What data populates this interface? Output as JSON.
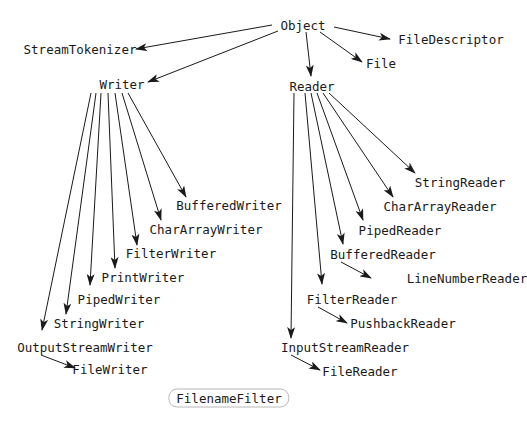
{
  "diagram": {
    "nodes": [
      {
        "id": "Object",
        "label": "Object",
        "x": 303,
        "y": 25
      },
      {
        "id": "StreamTokenizer",
        "label": "StreamTokenizer",
        "x": 80,
        "y": 49
      },
      {
        "id": "FileDescriptor",
        "label": "FileDescriptor",
        "x": 451,
        "y": 39
      },
      {
        "id": "File",
        "label": "File",
        "x": 381,
        "y": 63
      },
      {
        "id": "Writer",
        "label": "Writer",
        "x": 122,
        "y": 84
      },
      {
        "id": "Reader",
        "label": "Reader",
        "x": 312,
        "y": 86
      },
      {
        "id": "BufferedWriter",
        "label": "BufferedWriter",
        "x": 229,
        "y": 205
      },
      {
        "id": "CharArrayWriter",
        "label": "CharArrayWriter",
        "x": 206,
        "y": 229
      },
      {
        "id": "FilterWriter",
        "label": "FilterWriter",
        "x": 171,
        "y": 253
      },
      {
        "id": "PrintWriter",
        "label": "PrintWriter",
        "x": 143,
        "y": 277
      },
      {
        "id": "PipedWriter",
        "label": "PipedWriter",
        "x": 119,
        "y": 299
      },
      {
        "id": "StringWriter",
        "label": "StringWriter",
        "x": 99,
        "y": 323
      },
      {
        "id": "OutputStreamWriter",
        "label": "OutputStreamWriter",
        "x": 85,
        "y": 347
      },
      {
        "id": "FileWriter",
        "label": "FileWriter",
        "x": 110,
        "y": 369
      },
      {
        "id": "StringReader",
        "label": "StringReader",
        "x": 460,
        "y": 182
      },
      {
        "id": "CharArrayReader",
        "label": "CharArrayReader",
        "x": 440,
        "y": 206
      },
      {
        "id": "PipedReader",
        "label": "PipedReader",
        "x": 400,
        "y": 230
      },
      {
        "id": "BufferedReader",
        "label": "BufferedReader",
        "x": 383,
        "y": 254
      },
      {
        "id": "LineNumberReader",
        "label": "LineNumberReader",
        "x": 467,
        "y": 278
      },
      {
        "id": "FilterReader",
        "label": "FilterReader",
        "x": 352,
        "y": 299
      },
      {
        "id": "PushbackReader",
        "label": "PushbackReader",
        "x": 403,
        "y": 323
      },
      {
        "id": "InputStreamReader",
        "label": "InputStreamReader",
        "x": 345,
        "y": 347
      },
      {
        "id": "FileReader",
        "label": "FileReader",
        "x": 360,
        "y": 371
      },
      {
        "id": "FilenameFilter",
        "label": "FilenameFilter",
        "x": 229,
        "y": 398,
        "boxed": true
      }
    ],
    "edges": [
      {
        "from": [
          272,
          25
        ],
        "to": [
          136,
          49
        ]
      },
      {
        "from": [
          278,
          31
        ],
        "to": [
          148,
          82
        ]
      },
      {
        "from": [
          334,
          27
        ],
        "to": [
          390,
          39
        ]
      },
      {
        "from": [
          320,
          32
        ],
        "to": [
          362,
          62
        ]
      },
      {
        "from": [
          306,
          32
        ],
        "to": [
          311,
          76
        ]
      },
      {
        "from": [
          128,
          93
        ],
        "to": [
          186,
          197
        ]
      },
      {
        "from": [
          122,
          93
        ],
        "to": [
          161,
          220
        ]
      },
      {
        "from": [
          115,
          93
        ],
        "to": [
          137,
          245
        ]
      },
      {
        "from": [
          108,
          93
        ],
        "to": [
          115,
          268
        ]
      },
      {
        "from": [
          101,
          93
        ],
        "to": [
          90,
          285
        ]
      },
      {
        "from": [
          96,
          93
        ],
        "to": [
          66,
          314
        ]
      },
      {
        "from": [
          91,
          93
        ],
        "to": [
          42,
          330
        ]
      },
      {
        "from": [
          41,
          355
        ],
        "to": [
          75,
          368
        ]
      },
      {
        "from": [
          329,
          93
        ],
        "to": [
          415,
          173
        ]
      },
      {
        "from": [
          323,
          93
        ],
        "to": [
          393,
          197
        ]
      },
      {
        "from": [
          317,
          93
        ],
        "to": [
          363,
          220
        ]
      },
      {
        "from": [
          311,
          93
        ],
        "to": [
          343,
          244
        ]
      },
      {
        "from": [
          305,
          93
        ],
        "to": [
          322,
          284
        ]
      },
      {
        "from": [
          294,
          93
        ],
        "to": [
          291,
          338
        ]
      },
      {
        "from": [
          341,
          262
        ],
        "to": [
          371,
          278
        ]
      },
      {
        "from": [
          318,
          307
        ],
        "to": [
          347,
          323
        ]
      },
      {
        "from": [
          291,
          355
        ],
        "to": [
          320,
          370
        ]
      }
    ]
  }
}
